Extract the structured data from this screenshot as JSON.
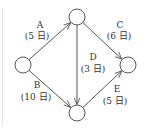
{
  "diagram": {
    "type": "activity-network",
    "nodes": [
      {
        "id": "start",
        "label": ""
      },
      {
        "id": "top",
        "label": ""
      },
      {
        "id": "bottom",
        "label": ""
      },
      {
        "id": "end",
        "label": ""
      }
    ],
    "edges": [
      {
        "id": "A",
        "from": "start",
        "to": "top",
        "name": "A",
        "duration": "(5 日)"
      },
      {
        "id": "B",
        "from": "start",
        "to": "bottom",
        "name": "B",
        "duration": "(10 日)"
      },
      {
        "id": "C",
        "from": "top",
        "to": "end",
        "name": "C",
        "duration": "(6 日)"
      },
      {
        "id": "D",
        "from": "top",
        "to": "bottom",
        "name": "D",
        "duration": "(3 日)"
      },
      {
        "id": "E",
        "from": "bottom",
        "to": "end",
        "name": "E",
        "duration": "(5 日)"
      }
    ],
    "colors": {
      "stroke": "#444444",
      "text": "#333333"
    }
  }
}
